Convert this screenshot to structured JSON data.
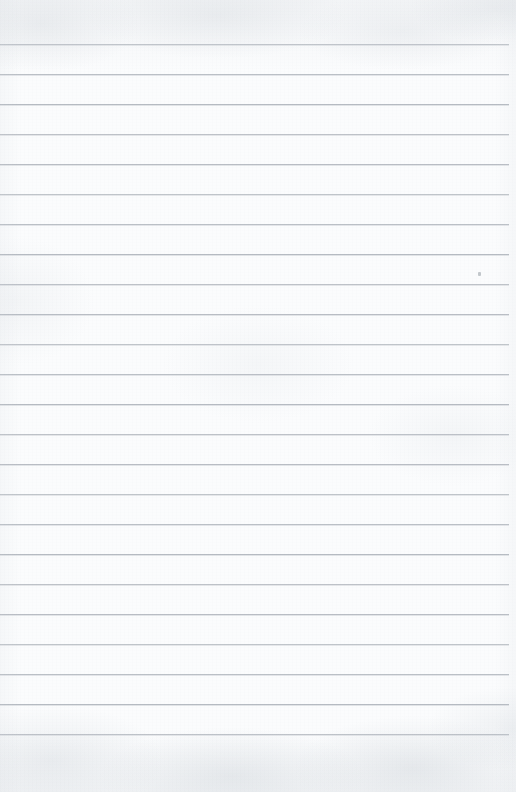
{
  "document": {
    "kind": "lined-notebook-paper",
    "page_width": 516,
    "page_height": 792,
    "background_color": "#fbfcfd",
    "rule_color": "#b4b9c0",
    "written_text": "",
    "has_margin_line": false,
    "has_header": false,
    "has_page_number": false
  },
  "ruling": {
    "line_count": 24,
    "first_line_y": 44,
    "line_spacing": 29.96,
    "line_thickness": 1,
    "line_left_x": 0,
    "line_right_x": 509,
    "top_margin_height": 44,
    "bottom_margin_height": 59,
    "lines_y": [
      44,
      74,
      104,
      134,
      164,
      194,
      224,
      254,
      284,
      314,
      344,
      374,
      404,
      434,
      464,
      494,
      524,
      554,
      584,
      614,
      644,
      674,
      704,
      734
    ]
  },
  "marks": [
    {
      "name": "paper-speck",
      "x": 478,
      "y": 272,
      "width": 3,
      "height": 4
    }
  ]
}
